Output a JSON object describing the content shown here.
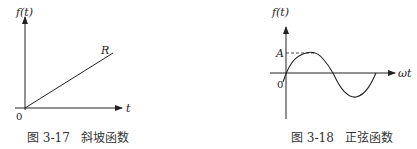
{
  "figures": [
    {
      "caption": "图 3-17   斜坡函数",
      "y_label": "f(t)",
      "x_label": "t",
      "origin_label": "0",
      "curve_label": "R",
      "type": "ramp"
    },
    {
      "caption": "图 3-18   正弦函数",
      "y_label": "f(t)",
      "x_label": "ωt",
      "origin_label": "0",
      "amplitude_label": "A",
      "type": "sine"
    }
  ]
}
